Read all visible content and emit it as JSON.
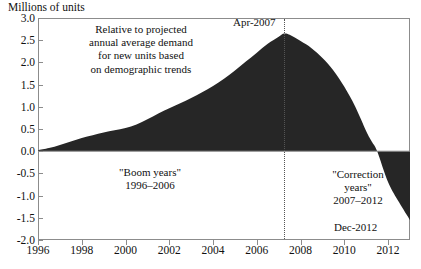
{
  "chart_data": {
    "type": "area",
    "title": "",
    "ylabel": "Millions of units",
    "xlabel": "",
    "ylim": [
      -2.0,
      3.0
    ],
    "xlim": [
      1996,
      2013
    ],
    "grid": false,
    "legend": "none",
    "ytick_labels": [
      "3.0",
      "2.5",
      "2.0",
      "1.5",
      "1.0",
      "0.5",
      "0.0",
      "-0.5",
      "-1.0",
      "-1.5",
      "-2.0"
    ],
    "ytick_values": [
      3.0,
      2.5,
      2.0,
      1.5,
      1.0,
      0.5,
      0.0,
      -0.5,
      -1.0,
      -1.5,
      -2.0
    ],
    "xtick_labels": [
      "1996",
      "1998",
      "2000",
      "2002",
      "2004",
      "2006",
      "2008",
      "2010",
      "2012"
    ],
    "xtick_values": [
      1996,
      1998,
      2000,
      2002,
      2004,
      2006,
      2008,
      2010,
      2012
    ],
    "series_name": "Excess housing units relative to projected demand",
    "fill_color": "#262626",
    "x": [
      1996.0,
      1996.5,
      1997.0,
      1997.5,
      1998.0,
      1998.5,
      1999.0,
      1999.5,
      2000.0,
      2000.5,
      2001.0,
      2001.5,
      2002.0,
      2002.5,
      2003.0,
      2003.5,
      2004.0,
      2004.5,
      2005.0,
      2005.5,
      2006.0,
      2006.5,
      2007.0,
      2007.25,
      2007.5,
      2008.0,
      2008.5,
      2009.0,
      2009.5,
      2010.0,
      2010.5,
      2011.0,
      2011.25,
      2011.5,
      2012.0,
      2012.5,
      2013.0
    ],
    "y": [
      0.02,
      0.07,
      0.14,
      0.22,
      0.3,
      0.36,
      0.42,
      0.47,
      0.52,
      0.6,
      0.72,
      0.85,
      0.97,
      1.08,
      1.2,
      1.33,
      1.47,
      1.63,
      1.82,
      2.02,
      2.22,
      2.42,
      2.58,
      2.65,
      2.62,
      2.48,
      2.32,
      2.1,
      1.82,
      1.45,
      1.0,
      0.45,
      0.22,
      0.0,
      -0.7,
      -1.15,
      -1.55
    ],
    "annotations": [
      {
        "name": "description",
        "text": "Relative to projected annual average demand for new units based on demographic trends"
      },
      {
        "name": "boom-years",
        "text": "\"Boom years\" 1996–2006"
      },
      {
        "name": "correction-years",
        "text": "\"Correction years\" 2007–2012"
      },
      {
        "name": "peak-marker",
        "text": "Apr-2007",
        "value": 2.65,
        "x": 2007.25
      },
      {
        "name": "end-marker",
        "text": "Dec-2012",
        "value": -1.55,
        "x": 2013.0
      }
    ],
    "vertical_marker": {
      "x": 2007.25,
      "style": "dotted",
      "label": "Apr-2007"
    }
  },
  "labels": {
    "y_axis_title": "Millions of units",
    "description_line1": "Relative to projected",
    "description_line2": "annual average demand",
    "description_line3": "for new units based",
    "description_line4": "on demographic trends",
    "boom_line1": "\"Boom years\"",
    "boom_line2": "1996–2006",
    "correction_line1": "\"Correction",
    "correction_line2": "years\"",
    "correction_line3": "2007–2012",
    "peak_label": "Apr-2007",
    "end_label": "Dec-2012"
  }
}
